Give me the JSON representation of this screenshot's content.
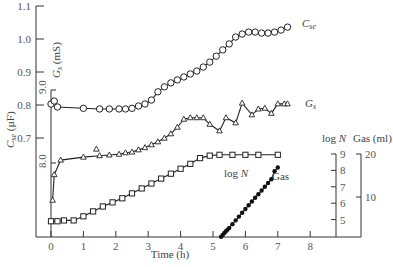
{
  "chart_data": {
    "type": "line",
    "title": "",
    "xlabel": "Time (h)",
    "xlim": [
      0,
      8
    ],
    "x_ticks": [
      "0",
      "1",
      "2",
      "3",
      "4",
      "5",
      "6",
      "7",
      "8"
    ],
    "axes": {
      "cse": {
        "label": "C_se (µF)",
        "label_main": "C",
        "label_sub": "se",
        "label_unit": " (µF)",
        "ylim": [
          0.6,
          1.1
        ],
        "ticks": [
          "1.1",
          "1.0",
          "0.9",
          "0.8",
          "0.7"
        ]
      },
      "gs": {
        "label": "G_s (mS)",
        "label_main": "G",
        "label_sub": "s",
        "label_unit": " (mS)",
        "ticks": [
          "9.0",
          "8.0"
        ]
      },
      "logn": {
        "label": "log N",
        "ticks": [
          "9",
          "8",
          "7",
          "6",
          "5"
        ]
      },
      "gas": {
        "label": "Gas (ml)",
        "ticks": [
          "20",
          "10"
        ]
      }
    },
    "series": [
      {
        "name": "C_se",
        "label_main": "C",
        "label_sub": "se",
        "marker": "open-circle",
        "axis": "cse",
        "x": [
          0,
          0.1,
          0.2,
          1,
          1.5,
          1.8,
          2.1,
          2.3,
          2.5,
          2.7,
          2.9,
          3.1,
          3.3,
          3.5,
          3.7,
          3.9,
          4.1,
          4.3,
          4.5,
          4.7,
          4.9,
          5.1,
          5.3,
          5.5,
          5.7,
          5.9,
          6.1,
          6.3,
          6.5,
          6.7,
          6.9,
          7.1,
          7.3
        ],
        "y": [
          0.803,
          0.812,
          0.794,
          0.79,
          0.788,
          0.788,
          0.788,
          0.788,
          0.79,
          0.797,
          0.803,
          0.815,
          0.84,
          0.855,
          0.867,
          0.876,
          0.885,
          0.894,
          0.903,
          0.915,
          0.93,
          0.948,
          0.967,
          0.985,
          1.006,
          1.015,
          1.021,
          1.021,
          1.018,
          1.018,
          1.021,
          1.027,
          1.036
        ]
      },
      {
        "name": "G_s",
        "label_main": "G",
        "label_sub": "s",
        "marker": "open-triangle",
        "axis": "gs",
        "x": [
          0.05,
          0.1,
          0.3,
          1,
          1.5,
          1.8,
          2.1,
          2.3,
          2.5,
          2.7,
          2.9,
          3.1,
          3.3,
          3.5,
          3.7,
          3.9,
          4.1,
          4.3,
          4.5,
          4.7,
          4.9,
          5.2,
          5.4,
          5.7,
          5.9,
          6.2,
          6.4,
          6.6,
          6.8,
          7.0,
          7.2,
          7.3
        ],
        "y": [
          7.49,
          7.84,
          8.04,
          8.08,
          8.1,
          8.11,
          8.12,
          8.14,
          8.15,
          8.18,
          8.21,
          8.25,
          8.29,
          8.34,
          8.4,
          8.49,
          8.6,
          8.62,
          8.62,
          8.62,
          8.53,
          8.44,
          8.62,
          8.55,
          8.82,
          8.66,
          8.74,
          8.75,
          8.68,
          8.81,
          8.81,
          8.81
        ],
        "outliers": [
          {
            "x": 1.4,
            "y": 8.19
          }
        ]
      },
      {
        "name": "log N",
        "marker": "open-square",
        "axis": "logn",
        "x": [
          0,
          0.2,
          0.4,
          0.7,
          1.0,
          1.3,
          1.6,
          1.9,
          2.2,
          2.5,
          2.8,
          3.1,
          3.4,
          3.7,
          4.0,
          4.3,
          4.6,
          4.9,
          5.2,
          5.6,
          6.0,
          6.4,
          7.0
        ],
        "y": [
          4.9,
          4.9,
          4.95,
          4.95,
          5.2,
          5.5,
          5.8,
          6.05,
          6.3,
          6.6,
          6.9,
          7.2,
          7.5,
          7.8,
          8.1,
          8.4,
          8.75,
          8.9,
          8.95,
          8.95,
          8.95,
          8.95,
          8.95
        ]
      },
      {
        "name": "Gas",
        "marker": "filled-circle",
        "axis": "gas",
        "x": [
          5.25,
          5.3,
          5.35,
          5.4,
          5.45,
          5.5,
          5.6,
          5.7,
          5.8,
          5.9,
          6.0,
          6.1,
          6.2,
          6.3,
          6.4,
          6.5,
          6.6,
          6.7,
          6.8,
          6.9,
          7.0
        ],
        "y": [
          0.3,
          0.7,
          1.2,
          1.6,
          2.0,
          2.4,
          3.3,
          4.2,
          5.1,
          6.0,
          6.9,
          7.8,
          8.7,
          9.6,
          10.4,
          11.3,
          12.2,
          13.1,
          14.0,
          15.9,
          16.8
        ]
      }
    ],
    "annotations": [
      "log N",
      "Gas"
    ],
    "grid": false,
    "legend": "inline labels at line ends"
  }
}
